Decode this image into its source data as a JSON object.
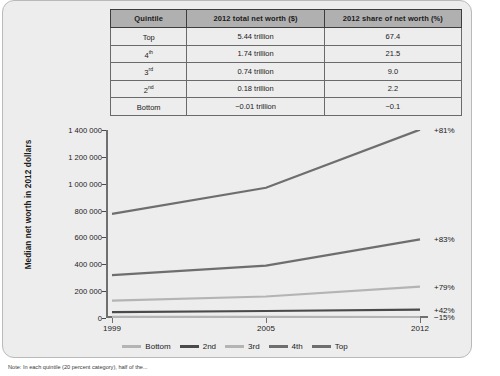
{
  "table": {
    "headers": [
      "Quintile",
      "2012 total net worth ($)",
      "2012 share of net worth (%)"
    ],
    "rows": [
      {
        "quintile": "Top",
        "ord": "",
        "networth": "5.44 trillion",
        "share": "67.4"
      },
      {
        "quintile": "4",
        "ord": "th",
        "networth": "1.74 trillion",
        "share": "21.5"
      },
      {
        "quintile": "3",
        "ord": "rd",
        "networth": "0.74 trillion",
        "share": "9.0"
      },
      {
        "quintile": "2",
        "ord": "nd",
        "networth": "0.18 trillion",
        "share": "2.2"
      },
      {
        "quintile": "Bottom",
        "ord": "",
        "networth": "−0.01 trillion",
        "share": "−0.1"
      }
    ]
  },
  "note": "Note: In each quintile (20 percent category), half of the...",
  "chart_data": {
    "type": "line",
    "title": "",
    "xlabel": "",
    "ylabel": "Median net worth in 2012 dollars",
    "x": [
      1999,
      2005,
      2012
    ],
    "xticklabels": [
      "1999",
      "2005",
      "2012"
    ],
    "yticklabels": [
      "0",
      "200 000",
      "400 000",
      "600 000",
      "800 000",
      "1 000 000",
      "1 200 000",
      "1 400 000"
    ],
    "yticks": [
      0,
      200000,
      400000,
      600000,
      800000,
      1000000,
      1200000,
      1400000
    ],
    "ylim": [
      0,
      1400000
    ],
    "grid": false,
    "legend_position": "bottom",
    "series": [
      {
        "name": "Bottom",
        "values": [
          9000,
          8000,
          7500
        ],
        "change": "−15%",
        "color": "#b4b4b4"
      },
      {
        "name": "2nd",
        "values": [
          44000,
          52000,
          62000
        ],
        "change": "+42%",
        "color": "#4a4a4a"
      },
      {
        "name": "3rd",
        "values": [
          130000,
          160000,
          233000
        ],
        "change": "+79%",
        "color": "#b4b4b4"
      },
      {
        "name": "4th",
        "values": [
          320000,
          390000,
          586000
        ],
        "change": "+83%",
        "color": "#6e6e6e"
      },
      {
        "name": "Top",
        "values": [
          775000,
          970000,
          1403000
        ],
        "change": "+81%",
        "color": "#6e6e6e"
      }
    ]
  }
}
